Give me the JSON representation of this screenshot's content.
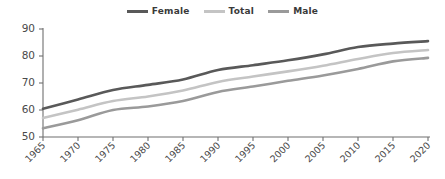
{
  "chart_data": {
    "type": "line",
    "title": "",
    "subtitle": "",
    "xlabel": "",
    "ylabel": "",
    "x": [
      1965,
      1970,
      1975,
      1980,
      1985,
      1990,
      1995,
      2000,
      2005,
      2010,
      2015,
      2020
    ],
    "categories": [
      "1965",
      "1970",
      "1975",
      "1980",
      "1985",
      "1990",
      "1995",
      "2000",
      "2005",
      "2010",
      "2015",
      "2020"
    ],
    "xlim": [
      1965,
      2020
    ],
    "ylim": [
      50,
      90
    ],
    "yticks": [
      50,
      60,
      70,
      80,
      90
    ],
    "ytick_labels": [
      "50",
      "60",
      "70",
      "80",
      "90"
    ],
    "xtick_labels": [
      "1965",
      "1970",
      "1975",
      "1980",
      "1985",
      "1990",
      "1995",
      "2000",
      "2005",
      "2010",
      "2015",
      "2020"
    ],
    "grid": false,
    "legend_position": "top-center",
    "xtick_rotation": 45,
    "series": [
      {
        "name": "Female",
        "color": "#595959",
        "width": 2.6,
        "values": [
          60.5,
          63.9,
          67.4,
          69.3,
          71.3,
          74.8,
          76.6,
          78.4,
          80.6,
          83.3,
          84.6,
          85.5
        ]
      },
      {
        "name": "Total",
        "color": "#c4c4c4",
        "width": 2.6,
        "values": [
          57.0,
          60.1,
          63.3,
          65.0,
          67.2,
          70.4,
          72.4,
          74.3,
          76.4,
          78.9,
          81.1,
          82.2
        ]
      },
      {
        "name": "Male",
        "color": "#9a9a9a",
        "width": 2.6,
        "values": [
          53.2,
          56.2,
          60.0,
          61.3,
          63.3,
          66.7,
          68.7,
          70.8,
          72.8,
          75.2,
          78.0,
          79.3
        ]
      }
    ]
  },
  "legend": {
    "items": [
      {
        "label": "Female",
        "color": "#595959"
      },
      {
        "label": "Total",
        "color": "#c4c4c4"
      },
      {
        "label": "Male",
        "color": "#9a9a9a"
      }
    ]
  },
  "axes": {
    "y_axis_color": "#6f6f6f",
    "x_axis_color": "#6f6f6f"
  }
}
